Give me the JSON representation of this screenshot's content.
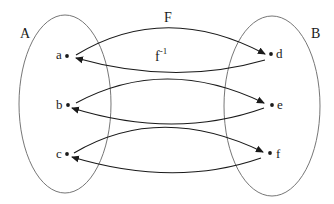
{
  "diagram": {
    "title_function": "F",
    "inverse_label": "f",
    "inverse_exponent": "-1",
    "sets": [
      {
        "name": "A",
        "elements": [
          "a",
          "b",
          "c"
        ]
      },
      {
        "name": "B",
        "elements": [
          "d",
          "e",
          "f"
        ]
      }
    ],
    "mappings": [
      {
        "from": "a",
        "to": "d",
        "direction": "forward"
      },
      {
        "from": "d",
        "to": "a",
        "direction": "inverse"
      },
      {
        "from": "b",
        "to": "e",
        "direction": "forward"
      },
      {
        "from": "e",
        "to": "b",
        "direction": "inverse"
      },
      {
        "from": "c",
        "to": "f",
        "direction": "forward"
      },
      {
        "from": "f",
        "to": "c",
        "direction": "inverse"
      }
    ],
    "colors": {
      "stroke": "#1a1a1a",
      "ellipse": "#555555",
      "background": "#ffffff"
    }
  }
}
